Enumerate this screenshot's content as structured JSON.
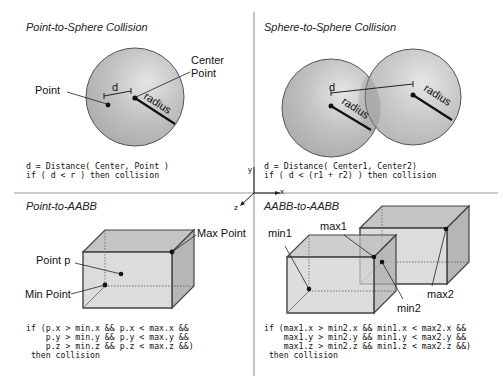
{
  "panels": {
    "point_sphere": {
      "title": "Point-to-Sphere Collision",
      "labels": {
        "point": "Point",
        "center_line1": "Center",
        "center_line2": "Point",
        "d": "d",
        "radius": "radius"
      },
      "code": [
        "d = Distance( Center, Point )",
        "if ( d < r ) then collision"
      ]
    },
    "sphere_sphere": {
      "title": "Sphere-to-Sphere Collision",
      "labels": {
        "d": "d",
        "radius1": "radius",
        "radius2": "radius"
      },
      "code": [
        "d = Distance( Center1, Center2)",
        "if ( d < (r1 + r2) ) then collision"
      ]
    },
    "point_aabb": {
      "title": "Point-to-AABB",
      "labels": {
        "max_point": "Max Point",
        "point_p": "Point p",
        "min_point": "Min Point"
      },
      "code": [
        "if (p.x > min.x && p.x < max.x &&",
        "    p.y > min.y && p.y < max.y &&",
        "    p.z > min.z && p.z < max.z &&)",
        " then collision"
      ]
    },
    "aabb_aabb": {
      "title": "AABB-to-AABB",
      "labels": {
        "min1": "min1",
        "max1": "max1",
        "min2": "min2",
        "max2": "max2"
      },
      "code": [
        "if (max1.x > min2.x && min1.x < max2.x &&",
        "    max1.y > min2.y && min1.y < max2.y &&",
        "    max1.z > min2.z && min1.z < max2.z &&)",
        " then collision"
      ]
    }
  },
  "axes": {
    "x": "x",
    "y": "y",
    "z": "z"
  },
  "colors": {
    "sphere_fill": "#b9b9b9",
    "box_fill": "#d6d6d6",
    "stroke": "#444444",
    "divider": "#888888"
  }
}
